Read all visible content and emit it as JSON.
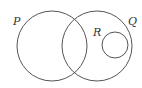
{
  "diagram": {
    "type": "venn",
    "stroke_color": "#555555",
    "background": "#ffffff",
    "sets": [
      {
        "id": "P",
        "label": "P",
        "cx": 52,
        "cy": 46,
        "r": 35,
        "label_x": 13,
        "label_y": 25
      },
      {
        "id": "Q",
        "label": "Q",
        "cx": 97,
        "cy": 46,
        "r": 35,
        "label_x": 128,
        "label_y": 25
      },
      {
        "id": "R",
        "label": "R",
        "cx": 115,
        "cy": 45,
        "r": 13,
        "label_x": 93,
        "label_y": 36
      }
    ],
    "relationships": [
      "P and Q overlap",
      "R is a subset of Q",
      "R is disjoint from P"
    ]
  }
}
